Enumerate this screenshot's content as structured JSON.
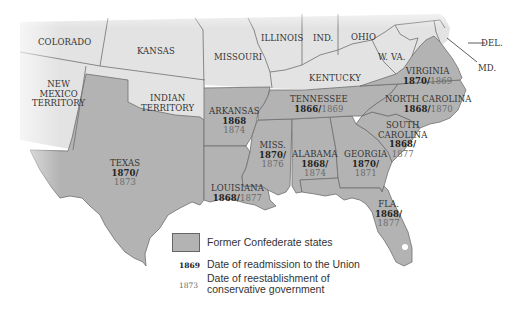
{
  "map": {
    "colors": {
      "confederate_fill": "#b3b3b3",
      "union_fill": "#e3e3e3",
      "border": "#6e6e6e",
      "water": "#ffffff"
    },
    "non_confederate_regions": [
      {
        "name": "COLORADO"
      },
      {
        "name": "KANSAS"
      },
      {
        "name": "MISSOURI"
      },
      {
        "name": "ILLINOIS"
      },
      {
        "name": "IND."
      },
      {
        "name": "OHIO"
      },
      {
        "name": "NEW MEXICO TERRITORY",
        "lines": [
          "NEW",
          "MEXICO",
          "TERRITORY"
        ]
      },
      {
        "name": "INDIAN TERRITORY",
        "lines": [
          "INDIAN",
          "TERRITORY"
        ]
      },
      {
        "name": "KENTUCKY"
      },
      {
        "name": "W. VA."
      },
      {
        "name": "DEL."
      },
      {
        "name": "MD."
      }
    ],
    "confederate_states": [
      {
        "name": "VIRGINIA",
        "readmission": "1870",
        "conservative_gov": "1869"
      },
      {
        "name": "NORTH CAROLINA",
        "readmission": "1868",
        "conservative_gov": "1870"
      },
      {
        "name": "TENNESSEE",
        "readmission": "1866",
        "conservative_gov": "1869"
      },
      {
        "name": "ARKANSAS",
        "readmission": "1868",
        "conservative_gov": "1874"
      },
      {
        "name": "SOUTH CAROLINA",
        "lines": [
          "SOUTH",
          "CAROLINA"
        ],
        "readmission": "1868",
        "conservative_gov": "1877"
      },
      {
        "name": "MISS.",
        "readmission": "1870",
        "conservative_gov": "1876"
      },
      {
        "name": "ALABAMA",
        "readmission": "1868",
        "conservative_gov": "1874"
      },
      {
        "name": "GEORGIA",
        "readmission": "1870",
        "conservative_gov": "1871"
      },
      {
        "name": "TEXAS",
        "readmission": "1870",
        "conservative_gov": "1873"
      },
      {
        "name": "LOUISIANA",
        "readmission": "1868",
        "conservative_gov": "1877"
      },
      {
        "name": "FLA.",
        "readmission": "1868",
        "conservative_gov": "1877"
      }
    ]
  },
  "legend": {
    "swatch_label": "Former Confederate states",
    "readmission_sample": "1869",
    "readmission_label": "Date of readmission to the Union",
    "conservative_sample": "1873",
    "conservative_label_line1": "Date of reestablishment of",
    "conservative_label_line2": "conservative government"
  }
}
